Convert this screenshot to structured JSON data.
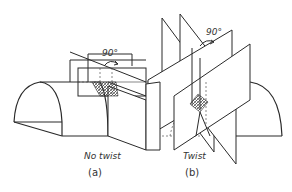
{
  "figure": {
    "panel_a": {
      "caption": "No twist",
      "letter": "(a)",
      "angle_label": "90°"
    },
    "panel_b": {
      "caption": "Twist",
      "letter": "(b)",
      "angle_label": "90°"
    }
  }
}
